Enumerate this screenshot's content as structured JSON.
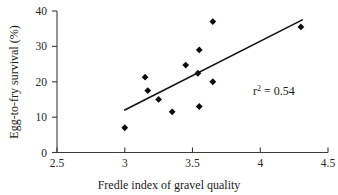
{
  "chart_data": {
    "type": "scatter",
    "title": "",
    "xlabel": "Fredle index of gravel quality",
    "ylabel": "Egg-to-fry survival (%)",
    "xlim": [
      2.5,
      4.5
    ],
    "ylim": [
      0,
      40
    ],
    "xticks": [
      "2.5",
      "3",
      "3.5",
      "4",
      "4.5"
    ],
    "xtick_values": [
      2.5,
      3,
      3.5,
      4,
      4.5
    ],
    "yticks": [
      "0",
      "10",
      "20",
      "30",
      "40"
    ],
    "ytick_values": [
      0,
      10,
      20,
      30,
      40
    ],
    "grid": false,
    "legend": null,
    "marker": "diamond",
    "marker_color": "#0d0d0d",
    "x": [
      3.0,
      3.15,
      3.17,
      3.25,
      3.35,
      3.45,
      3.54,
      3.55,
      3.55,
      3.65,
      3.65,
      4.3
    ],
    "y": [
      7.0,
      21.3,
      17.5,
      15.0,
      11.5,
      24.7,
      22.4,
      29.0,
      13.0,
      37.0,
      20.0,
      35.5
    ],
    "points": [
      {
        "x": 3.0,
        "y": 7.0
      },
      {
        "x": 3.15,
        "y": 21.3
      },
      {
        "x": 3.17,
        "y": 17.5
      },
      {
        "x": 3.25,
        "y": 15.0
      },
      {
        "x": 3.35,
        "y": 11.5
      },
      {
        "x": 3.45,
        "y": 24.7
      },
      {
        "x": 3.54,
        "y": 22.4
      },
      {
        "x": 3.55,
        "y": 29.0
      },
      {
        "x": 3.55,
        "y": 13.0
      },
      {
        "x": 3.65,
        "y": 37.0
      },
      {
        "x": 3.65,
        "y": 20.0
      },
      {
        "x": 4.3,
        "y": 35.5
      }
    ],
    "trendline": {
      "type": "linear-fit",
      "x_start": 3.0,
      "y_start": 12.0,
      "x_end": 4.31,
      "y_end": 37.5,
      "color": "#111111"
    },
    "annotations": [
      {
        "name": "r-squared",
        "prefix": "r",
        "superscript": "2",
        "suffix": " = 0.54",
        "text": "r2 = 0.54",
        "x": 4.0,
        "y": 17.0
      }
    ]
  }
}
